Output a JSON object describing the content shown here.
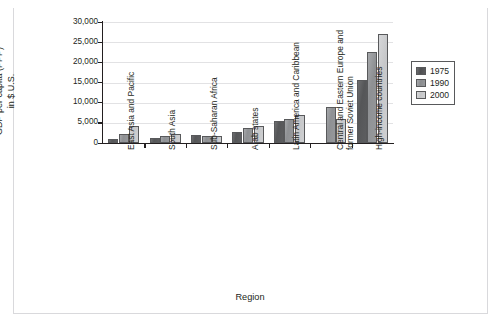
{
  "caption": {
    "partial_text": ""
  },
  "axis_titles": {
    "x": "Region",
    "y_line1": "GDP per capita (PPP)",
    "y_line2": "in $ U.S."
  },
  "legend": {
    "position": "right",
    "entries": [
      {
        "label": "1975",
        "color": "#58595b"
      },
      {
        "label": "1990",
        "color": "#939598"
      },
      {
        "label": "2000",
        "color": "#cccdcf"
      }
    ]
  },
  "chart_data": {
    "type": "bar",
    "title": "",
    "xlabel": "Region",
    "ylabel": "GDP per capita (PPP) in $ U.S.",
    "ylim": [
      0,
      30000
    ],
    "yticks": [
      0,
      5000,
      10000,
      15000,
      20000,
      25000,
      30000
    ],
    "ytick_labels": [
      "0",
      "5,000",
      "10,000",
      "15,000",
      "20,000",
      "25,000",
      "30,000"
    ],
    "grid": true,
    "grid_axis": "y",
    "legend_position": "right",
    "categories": [
      "East Asia and Pacific",
      "South Asia",
      "Sub-Saharan Africa",
      "Arab states",
      "Latin America and Caribbean",
      "Central and Eastern Europe and former Soviet Union",
      "High-income countries"
    ],
    "category_lines": [
      [
        "East Asia and Pacific"
      ],
      [
        "South Asia"
      ],
      [
        "Sub-Saharan Africa"
      ],
      [
        "Arab states"
      ],
      [
        "Latin America and Caribbean"
      ],
      [
        "Central and Eastern Europe and",
        "former Soviet Union"
      ],
      [
        "High-income countries"
      ]
    ],
    "series": [
      {
        "name": "1975",
        "color": "#58595b",
        "values": [
          900,
          1300,
          2100,
          2800,
          5500,
          null,
          15500
        ]
      },
      {
        "name": "1990",
        "color": "#939598",
        "values": [
          2200,
          1700,
          1700,
          3800,
          6000,
          9000,
          22500
        ]
      },
      {
        "name": "2000",
        "color": "#cccdcf",
        "values": [
          4300,
          2300,
          1700,
          4300,
          7000,
          6000,
          27000
        ]
      }
    ]
  }
}
